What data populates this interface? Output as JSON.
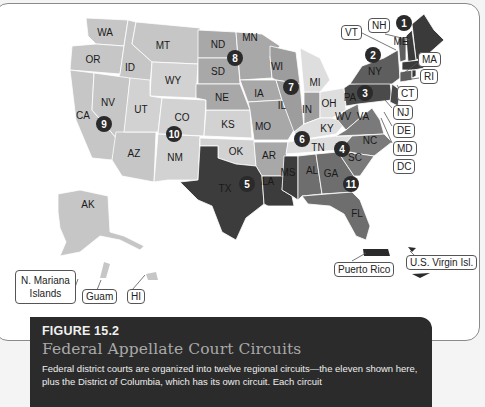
{
  "figure": {
    "number": "FIGURE 15.2",
    "title": "Federal Appellate Court Circuits",
    "body": "Federal district courts are organized into twelve regional circuits—the eleven shown here, plus the District of Columbia, which has its own circuit. Each circuit"
  },
  "colors": {
    "circuit_1": "#3a3a3a",
    "circuit_2": "#5e5e5e",
    "circuit_3": "#4a4a4a",
    "circuit_4": "#7a7a7a",
    "circuit_5": "#3c3c3c",
    "circuit_6": "#dedede",
    "circuit_7": "#9d9d9d",
    "circuit_8": "#a8a8a8",
    "circuit_9": "#c6c6c6",
    "circuit_10": "#d2d2d2",
    "circuit_11": "#6e6e6e",
    "marker": "#2a2a2a",
    "caption_bg": "#2b2b2b",
    "caption_title": "#a9a9a9"
  },
  "states": {
    "WA": "WA",
    "OR": "OR",
    "ID": "ID",
    "MT": "MT",
    "WY": "WY",
    "CA": "CA",
    "NV": "NV",
    "UT": "UT",
    "AZ": "AZ",
    "CO": "CO",
    "NM": "NM",
    "ND": "ND",
    "SD": "SD",
    "NE": "NE",
    "KS": "KS",
    "OK": "OK",
    "TX": "TX",
    "MN": "MN",
    "IA": "IA",
    "MO": "MO",
    "AR": "AR",
    "LA": "LA",
    "WI": "WI",
    "IL": "IL",
    "MI": "MI",
    "IN": "IN",
    "OH": "OH",
    "KY": "KY",
    "TN": "TN",
    "MS": "MS",
    "AL": "AL",
    "GA": "GA",
    "FL": "FL",
    "WV": "WV",
    "VA": "VA",
    "NC": "NC",
    "SC": "SC",
    "PA": "PA",
    "NY": "NY",
    "ME": "ME",
    "AK": "AK"
  },
  "circuit_markers": [
    "1",
    "2",
    "3",
    "4",
    "5",
    "6",
    "7",
    "8",
    "9",
    "10",
    "11"
  ],
  "callouts": {
    "VT": "VT",
    "NH": "NH",
    "MA": "MA",
    "RI": "RI",
    "CT": "CT",
    "NJ": "NJ",
    "DE": "DE",
    "MD": "MD",
    "DC": "DC",
    "mariana_line1": "N. Mariana",
    "mariana_line2": "Islands",
    "guam": "Guam",
    "hi": "HI",
    "puerto_rico": "Puerto Rico",
    "usvi": "U.S. Virgin Isl."
  }
}
